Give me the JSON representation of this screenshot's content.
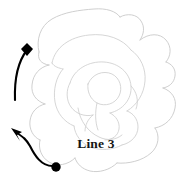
{
  "figure": {
    "title": "",
    "background_color": "#ffffff",
    "width": 193,
    "height": 181
  },
  "subject": {
    "name": "rose-outline-drawing",
    "description": "Line drawing of a rose flower",
    "outline_color": "#c9c9c9",
    "inner_color": "#cfcfcf"
  },
  "annotations": {
    "color": "#000000",
    "leader_lines": [
      {
        "name": "upper-leader-line",
        "end_marker": "diamond",
        "marker_position": {
          "x": 27,
          "y": 49
        },
        "path": "M 27 49 C 20 58, 14 72, 15 100"
      },
      {
        "name": "lower-leader-line",
        "end_marker": "circle",
        "marker_position": {
          "x": 56,
          "y": 167
        },
        "arrow_tip": {
          "x": 12,
          "y": 129
        },
        "path": "M 56 167 C 42 168, 34 154, 30 146 C 26 139, 22 137, 16 133"
      }
    ],
    "labels": [
      {
        "name": "line-3-label",
        "text": "Line 3",
        "x": 96,
        "y": 148,
        "color": "#151515"
      }
    ]
  }
}
